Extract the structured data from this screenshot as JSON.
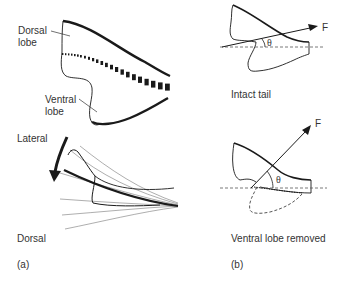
{
  "figure": {
    "panel_a": {
      "label": "(a)",
      "labels": {
        "dorsal_lobe_line1": "Dorsal",
        "dorsal_lobe_line2": "lobe",
        "ventral_lobe_line1": "Ventral",
        "ventral_lobe_line2": "lobe",
        "lateral": "Lateral",
        "dorsal": "Dorsal"
      }
    },
    "panel_b": {
      "label": "(b)",
      "intact": {
        "caption": "Intact tail",
        "force_label": "F",
        "angle_label": "θ"
      },
      "removed": {
        "caption": "Ventral lobe removed",
        "force_label": "F",
        "angle_label": "θ"
      }
    },
    "colors": {
      "ink": "#1a1a1a",
      "text": "#333333",
      "thin_line": "#777777"
    }
  }
}
